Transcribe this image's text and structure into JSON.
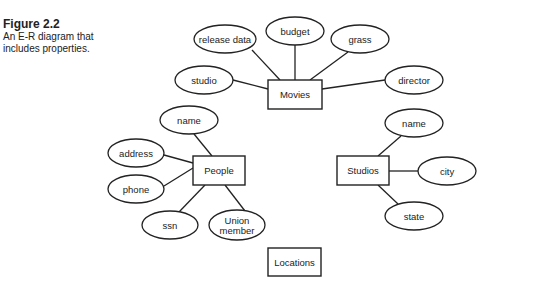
{
  "caption": {
    "figure_label": "Figure 2.2",
    "description_line1": "An E-R diagram that",
    "description_line2": "includes properties."
  },
  "entities": [
    {
      "id": "movies",
      "label": "Movies",
      "x": 268,
      "y": 80,
      "w": 54,
      "h": 29
    },
    {
      "id": "people",
      "label": "People",
      "x": 193,
      "y": 156,
      "w": 52,
      "h": 29
    },
    {
      "id": "studios",
      "label": "Studios",
      "x": 337,
      "y": 156,
      "w": 52,
      "h": 29
    },
    {
      "id": "locations",
      "label": "Locations",
      "x": 268,
      "y": 248,
      "w": 53,
      "h": 28
    }
  ],
  "attributes": [
    {
      "id": "movies-release-data",
      "entity": "movies",
      "label": "release data",
      "cx": 225,
      "cy": 39,
      "rx": 31,
      "ry": 14,
      "lx1": 252,
      "ly1": 50,
      "lx2": 280,
      "ly2": 80
    },
    {
      "id": "movies-budget",
      "entity": "movies",
      "label": "budget",
      "cx": 295,
      "cy": 31,
      "rx": 29,
      "ry": 14,
      "lx1": 295,
      "ly1": 45,
      "lx2": 295,
      "ly2": 80
    },
    {
      "id": "movies-grass",
      "entity": "movies",
      "label": "grass",
      "cx": 360,
      "cy": 39,
      "rx": 29,
      "ry": 14,
      "lx1": 348,
      "ly1": 52,
      "lx2": 310,
      "ly2": 80
    },
    {
      "id": "movies-studio",
      "entity": "movies",
      "label": "studio",
      "cx": 204,
      "cy": 80,
      "rx": 29,
      "ry": 14,
      "lx1": 233,
      "ly1": 80,
      "lx2": 268,
      "ly2": 89
    },
    {
      "id": "movies-director",
      "entity": "movies",
      "label": "director",
      "cx": 414,
      "cy": 80,
      "rx": 29,
      "ry": 14,
      "lx1": 385,
      "ly1": 80,
      "lx2": 322,
      "ly2": 89
    },
    {
      "id": "people-name",
      "entity": "people",
      "label": "name",
      "cx": 189,
      "cy": 120,
      "rx": 29,
      "ry": 14,
      "lx1": 194,
      "ly1": 134,
      "lx2": 212,
      "ly2": 156
    },
    {
      "id": "people-address",
      "entity": "people",
      "label": "address",
      "cx": 136,
      "cy": 153,
      "rx": 28,
      "ry": 14,
      "lx1": 164,
      "ly1": 155,
      "lx2": 193,
      "ly2": 163
    },
    {
      "id": "people-phone",
      "entity": "people",
      "label": "phone",
      "cx": 136,
      "cy": 189,
      "rx": 28,
      "ry": 14,
      "lx1": 164,
      "ly1": 186,
      "lx2": 193,
      "ly2": 168
    },
    {
      "id": "people-ssn",
      "entity": "people",
      "label": "ssn",
      "cx": 170,
      "cy": 225,
      "rx": 28,
      "ry": 14,
      "lx1": 179,
      "ly1": 212,
      "lx2": 205,
      "ly2": 185
    },
    {
      "id": "people-union-member",
      "entity": "people",
      "label": "Union member",
      "line1": "Union",
      "line2": "member",
      "cx": 237,
      "cy": 225,
      "rx": 28,
      "ry": 15,
      "lx1": 245,
      "ly1": 211,
      "lx2": 225,
      "ly2": 185
    },
    {
      "id": "studios-name",
      "entity": "studios",
      "label": "name",
      "cx": 414,
      "cy": 123,
      "rx": 29,
      "ry": 14,
      "lx1": 401,
      "ly1": 136,
      "lx2": 378,
      "ly2": 156
    },
    {
      "id": "studios-city",
      "entity": "studios",
      "label": "city",
      "cx": 447,
      "cy": 171,
      "rx": 29,
      "ry": 14,
      "lx1": 418,
      "ly1": 171,
      "lx2": 389,
      "ly2": 171
    },
    {
      "id": "studios-state",
      "entity": "studios",
      "label": "state",
      "cx": 414,
      "cy": 216,
      "rx": 29,
      "ry": 14,
      "lx1": 398,
      "ly1": 204,
      "lx2": 378,
      "ly2": 185
    }
  ],
  "colors": {
    "stroke": "#222222",
    "fill": "#ffffff",
    "text": "#222222"
  }
}
